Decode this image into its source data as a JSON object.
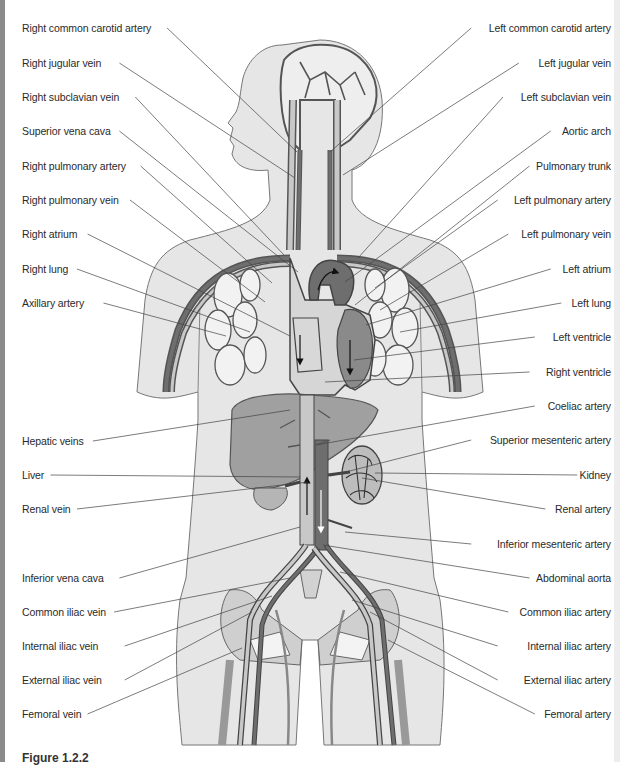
{
  "figure": {
    "caption": "Figure 1.2.2",
    "colors": {
      "body_fill": "#e6e6e6",
      "body_outline": "#777777",
      "vein_light": "#c8c8c8",
      "artery_dark": "#6e6e6e",
      "organ_mid": "#9a9a9a",
      "leader_line": "#444444",
      "label_text": "#2a2a2a"
    }
  },
  "labels_left": [
    {
      "text": "Right common carotid artery",
      "x": 22,
      "y": 28,
      "tx": 297,
      "ty": 152
    },
    {
      "text": "Right jugular vein",
      "x": 22,
      "y": 63,
      "tx": 295,
      "ty": 178
    },
    {
      "text": "Right subclavian vein",
      "x": 22,
      "y": 97,
      "tx": 284,
      "ty": 255
    },
    {
      "text": "Superior vena cava",
      "x": 22,
      "y": 131,
      "tx": 298,
      "ty": 272
    },
    {
      "text": "Right pulmonary artery",
      "x": 22,
      "y": 166,
      "tx": 272,
      "ty": 283
    },
    {
      "text": "Right pulmonary vein",
      "x": 22,
      "y": 200,
      "tx": 265,
      "ty": 302
    },
    {
      "text": "Right atrium",
      "x": 22,
      "y": 234,
      "tx": 290,
      "ty": 336
    },
    {
      "text": "Right lung",
      "x": 22,
      "y": 269,
      "tx": 250,
      "ty": 332
    },
    {
      "text": "Axillary artery",
      "x": 22,
      "y": 303,
      "tx": 226,
      "ty": 336
    },
    {
      "text": "Hepatic veins",
      "x": 22,
      "y": 441,
      "tx": 290,
      "ty": 410
    },
    {
      "text": "Liver",
      "x": 22,
      "y": 475,
      "tx": 300,
      "ty": 477
    },
    {
      "text": "Renal vein",
      "x": 22,
      "y": 509,
      "tx": 308,
      "ty": 482
    },
    {
      "text": "Inferior vena cava",
      "x": 22,
      "y": 578,
      "tx": 300,
      "ty": 527
    },
    {
      "text": "Common iliac vein",
      "x": 22,
      "y": 612,
      "tx": 290,
      "ty": 578
    },
    {
      "text": "Internal iliac vein",
      "x": 22,
      "y": 646,
      "tx": 272,
      "ty": 596
    },
    {
      "text": "External iliac vein",
      "x": 22,
      "y": 680,
      "tx": 252,
      "ty": 612
    },
    {
      "text": "Femoral vein",
      "x": 22,
      "y": 714,
      "tx": 242,
      "ty": 648
    }
  ],
  "labels_right": [
    {
      "text": "Left common carotid artery",
      "x": 611,
      "y": 28,
      "tx": 330,
      "ty": 152
    },
    {
      "text": "Left jugular vein",
      "x": 611,
      "y": 63,
      "tx": 343,
      "ty": 175
    },
    {
      "text": "Left subclavian vein",
      "x": 611,
      "y": 97,
      "tx": 358,
      "ty": 258
    },
    {
      "text": "Aortic arch",
      "x": 611,
      "y": 131,
      "tx": 345,
      "ty": 282
    },
    {
      "text": "Pulmonary trunk",
      "x": 611,
      "y": 166,
      "tx": 355,
      "ty": 305
    },
    {
      "text": "Left pulmonary artery",
      "x": 611,
      "y": 200,
      "tx": 375,
      "ty": 288
    },
    {
      "text": "Left pulmonary vein",
      "x": 611,
      "y": 234,
      "tx": 380,
      "ty": 310
    },
    {
      "text": "Left atrium",
      "x": 611,
      "y": 269,
      "tx": 366,
      "ty": 325
    },
    {
      "text": "Left lung",
      "x": 611,
      "y": 303,
      "tx": 400,
      "ty": 332
    },
    {
      "text": "Left ventricle",
      "x": 611,
      "y": 337,
      "tx": 354,
      "ty": 360
    },
    {
      "text": "Right ventricle",
      "x": 611,
      "y": 372,
      "tx": 325,
      "ty": 382
    },
    {
      "text": "Coeliac artery",
      "x": 611,
      "y": 406,
      "tx": 316,
      "ty": 445
    },
    {
      "text": "Superior mesenteric artery",
      "x": 611,
      "y": 440,
      "tx": 330,
      "ty": 476
    },
    {
      "text": "Kidney",
      "x": 611,
      "y": 475,
      "tx": 375,
      "ty": 473
    },
    {
      "text": "Renal artery",
      "x": 611,
      "y": 509,
      "tx": 362,
      "ty": 478
    },
    {
      "text": "Inferior mesenteric artery",
      "x": 611,
      "y": 544,
      "tx": 345,
      "ty": 532
    },
    {
      "text": "Abdominal aorta",
      "x": 611,
      "y": 578,
      "tx": 323,
      "ty": 545
    },
    {
      "text": "Common iliac artery",
      "x": 611,
      "y": 612,
      "tx": 340,
      "ty": 572
    },
    {
      "text": "Internal iliac artery",
      "x": 611,
      "y": 646,
      "tx": 352,
      "ty": 600
    },
    {
      "text": "External iliac artery",
      "x": 611,
      "y": 680,
      "tx": 370,
      "ty": 612
    },
    {
      "text": "Femoral artery",
      "x": 611,
      "y": 714,
      "tx": 388,
      "ty": 640
    }
  ]
}
